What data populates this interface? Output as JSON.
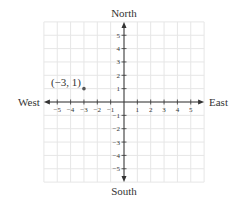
{
  "diagram": {
    "type": "coordinate-grid",
    "directions": {
      "north": "North",
      "south": "South",
      "east": "East",
      "west": "West"
    },
    "x_range": [
      -6,
      6
    ],
    "y_range": [
      -6,
      6
    ],
    "x_ticks": [
      -5,
      -4,
      -3,
      -2,
      -1,
      1,
      2,
      3,
      4,
      5
    ],
    "y_ticks": [
      -5,
      -4,
      -3,
      -2,
      -1,
      1,
      2,
      3,
      4,
      5
    ],
    "x_tick_labels": [
      "−5",
      "−4",
      "−3",
      "−2",
      "−1",
      "1",
      "2",
      "3",
      "4",
      "5"
    ],
    "y_tick_labels": [
      "−5",
      "−4",
      "−3",
      "−2",
      "−1",
      "1",
      "2",
      "3",
      "4",
      "5"
    ],
    "points": [
      {
        "x": -3,
        "y": 1,
        "label": "(−3, 1)"
      }
    ],
    "colors": {
      "grid": "#e6e6e6",
      "axis": "#333333",
      "point": "#555555",
      "text": "#333333"
    }
  }
}
